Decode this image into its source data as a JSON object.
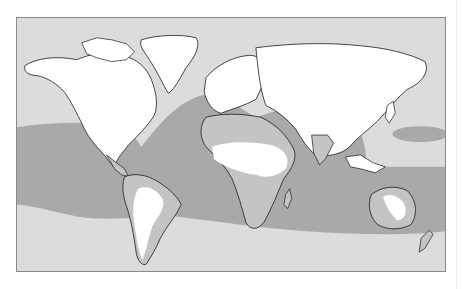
{
  "map": {
    "title": "",
    "colors": {
      "ocean": "#dcdcdc",
      "zone": "#a9a9a9",
      "land": "#ffffff",
      "land_in_zone": "#c4c4c4",
      "coastline": "#1a1a1a",
      "frame": "#8a8a8a"
    },
    "legend": []
  }
}
